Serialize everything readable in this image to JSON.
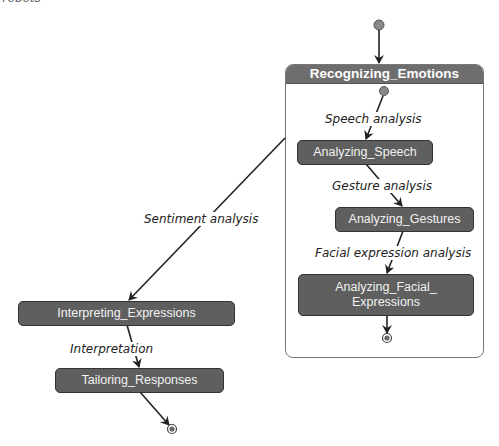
{
  "page": {
    "cut_text": "robots"
  },
  "composite": {
    "title": "Recognizing_Emotions"
  },
  "states": {
    "analyzing_speech": "Analyzing_Speech",
    "analyzing_gestures": "Analyzing_Gestures",
    "analyzing_facial_line1": "Analyzing_Facial_",
    "analyzing_facial_line2": "Expressions",
    "interpreting_expressions": "Interpreting_Expressions",
    "tailoring_responses": "Tailoring_Responses"
  },
  "transitions": {
    "speech_analysis": "Speech analysis",
    "gesture_analysis": "Gesture analysis",
    "facial_expression_analysis": "Facial expression analysis",
    "sentiment_analysis": "Sentiment analysis",
    "interpretation": "Interpretation"
  },
  "colors": {
    "state_fill": "#5f5f5f",
    "header_fill": "#6e6e6e",
    "initial_dot": "#808080",
    "line": "#222222"
  }
}
